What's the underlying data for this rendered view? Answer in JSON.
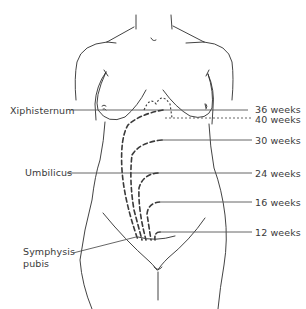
{
  "figure": {
    "landmarks": [
      {
        "id": "xiphisternum",
        "label": "Xiphisternum",
        "y": 110
      },
      {
        "id": "umbilicus",
        "label": "Umbilicus",
        "y": 173
      },
      {
        "id": "symphysis",
        "label_line1": "Symphysis",
        "label_line2": "pubis",
        "y": 238
      }
    ],
    "gestation_markers": [
      {
        "weeks": 36,
        "label": "36 weeks",
        "y": 110,
        "style": "solid"
      },
      {
        "weeks": 40,
        "label": "40 weeks",
        "y": 118,
        "style": "dotted"
      },
      {
        "weeks": 30,
        "label": "30 weeks",
        "y": 140,
        "style": "solid"
      },
      {
        "weeks": 24,
        "label": "24 weeks",
        "y": 173,
        "style": "solid"
      },
      {
        "weeks": 16,
        "label": "16 weeks",
        "y": 202,
        "style": "solid"
      },
      {
        "weeks": 12,
        "label": "12 weeks",
        "y": 232,
        "style": "solid"
      }
    ],
    "colors": {
      "line": "#2e2e2e",
      "text": "#3a3a3a",
      "background": "#ffffff"
    }
  }
}
